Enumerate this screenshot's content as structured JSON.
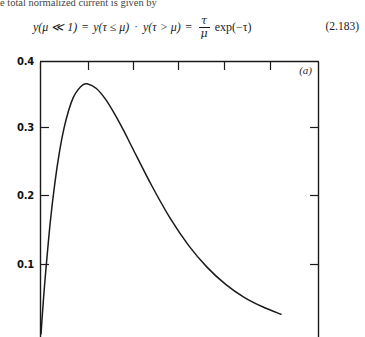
{
  "document": {
    "running_text": "e total normalized current is given by",
    "equation": {
      "lhs": "y(μ ≪ 1)",
      "eq1": "=",
      "term1": "y(τ ≤ μ)",
      "dot": "·",
      "term2": "y(τ > μ)",
      "eq2": "=",
      "fraction_numerator": "τ",
      "fraction_denominator": "μ",
      "exponential": "exp(−τ)",
      "number": "(2.183)"
    }
  },
  "figure": {
    "panel_label": "(a)",
    "frame_color": "#1a1a1a",
    "curve_color": "#1a1a1a"
  },
  "chart_data": {
    "type": "line",
    "title": "",
    "subtitle": "",
    "xlabel": "",
    "ylabel": "",
    "panel_label": "(a)",
    "grid": false,
    "legend": null,
    "ylim": [
      0.0,
      0.4
    ],
    "xlim": [
      0.0,
      6.0
    ],
    "ytick_labels": [
      "0.4",
      "0.3",
      "0.2",
      "0.1"
    ],
    "ytick_values": [
      0.4,
      0.3,
      0.2,
      0.1
    ],
    "xtick_values": [
      1,
      2,
      3,
      4,
      5
    ],
    "xtick_labels": [],
    "axis_note": "bottom axis is cropped off the image; top, left and right frame edges visible with inward ticks",
    "series": [
      {
        "name": "y = τ exp(−τ)",
        "x": [
          0.0,
          0.05,
          0.1,
          0.2,
          0.3,
          0.4,
          0.5,
          0.6,
          0.7,
          0.8,
          0.9,
          1.0,
          1.2,
          1.4,
          1.6,
          1.8,
          2.0,
          2.4,
          2.8,
          3.2,
          3.6,
          4.0,
          4.4,
          4.8,
          5.2
        ],
        "values": [
          0.0,
          0.048,
          0.09,
          0.164,
          0.222,
          0.268,
          0.303,
          0.329,
          0.348,
          0.359,
          0.366,
          0.368,
          0.361,
          0.345,
          0.323,
          0.298,
          0.271,
          0.218,
          0.17,
          0.13,
          0.098,
          0.073,
          0.054,
          0.04,
          0.029
        ]
      }
    ]
  }
}
